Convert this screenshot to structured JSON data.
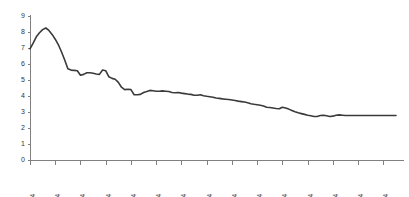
{
  "chart_data": {
    "type": "line",
    "title": "",
    "subtitle": "",
    "xlabel": "",
    "ylabel": "",
    "grid": false,
    "legend": false,
    "legend_position": "none",
    "line_color": "#3a3a3a",
    "axis_color": "#808080",
    "ylim": [
      0,
      9
    ],
    "yticks": [
      0,
      1,
      2,
      3,
      4,
      5,
      6,
      7,
      8,
      9
    ],
    "ytick_labels": [
      "0",
      "1",
      "2",
      "3",
      "4",
      "5",
      "6",
      "7",
      "8",
      "9"
    ],
    "xtick_labels": [
      "1979:4",
      "1981:4",
      "1983:4",
      "1985:4",
      "1987:4",
      "1989:4",
      "1991:4",
      "1993:4",
      "1995:4",
      "1997:4",
      "1999:4",
      "2001:4",
      "2003:4",
      "2005:4",
      "2007:4"
    ],
    "xtick_indices": [
      0,
      8,
      16,
      24,
      32,
      40,
      48,
      56,
      64,
      72,
      80,
      88,
      96,
      104,
      112
    ],
    "x": [
      "1979:4",
      "1980:1",
      "1980:2",
      "1980:3",
      "1980:4",
      "1981:1",
      "1981:2",
      "1981:3",
      "1981:4",
      "1982:1",
      "1982:2",
      "1982:3",
      "1982:4",
      "1983:1",
      "1983:2",
      "1983:3",
      "1983:4",
      "1984:1",
      "1984:2",
      "1984:3",
      "1984:4",
      "1985:1",
      "1985:2",
      "1985:3",
      "1985:4",
      "1986:1",
      "1986:2",
      "1986:3",
      "1986:4",
      "1987:1",
      "1987:2",
      "1987:3",
      "1987:4",
      "1988:1",
      "1988:2",
      "1988:3",
      "1988:4",
      "1989:1",
      "1989:2",
      "1989:3",
      "1989:4",
      "1990:1",
      "1990:2",
      "1990:3",
      "1990:4",
      "1991:1",
      "1991:2",
      "1991:3",
      "1991:4",
      "1992:1",
      "1992:2",
      "1992:3",
      "1992:4",
      "1993:1",
      "1993:2",
      "1993:3",
      "1993:4",
      "1994:1",
      "1994:2",
      "1994:3",
      "1994:4",
      "1995:1",
      "1995:2",
      "1995:3",
      "1995:4",
      "1996:1",
      "1996:2",
      "1996:3",
      "1996:4",
      "1997:1",
      "1997:2",
      "1997:3",
      "1997:4",
      "1998:1",
      "1998:2",
      "1998:3",
      "1998:4",
      "1999:1",
      "1999:2",
      "1999:3",
      "1999:4",
      "2000:1",
      "2000:2",
      "2000:3",
      "2000:4",
      "2001:1",
      "2001:2",
      "2001:3",
      "2001:4",
      "2002:1",
      "2002:2",
      "2002:3",
      "2002:4",
      "2003:1",
      "2003:2",
      "2003:3",
      "2003:4",
      "2004:1",
      "2004:2",
      "2004:3",
      "2004:4",
      "2005:1",
      "2005:2",
      "2005:3",
      "2005:4",
      "2006:1",
      "2006:2",
      "2006:3",
      "2006:4",
      "2007:1",
      "2007:2",
      "2007:3",
      "2007:4",
      "2008:1",
      "2008:2",
      "2008:3",
      "2008:4"
    ],
    "values": [
      6.95,
      7.3,
      7.7,
      7.95,
      8.15,
      8.25,
      8.1,
      7.85,
      7.55,
      7.2,
      6.75,
      6.25,
      5.7,
      5.62,
      5.6,
      5.58,
      5.3,
      5.35,
      5.45,
      5.45,
      5.42,
      5.38,
      5.35,
      5.62,
      5.58,
      5.2,
      5.1,
      5.05,
      4.85,
      4.55,
      4.4,
      4.42,
      4.4,
      4.08,
      4.08,
      4.1,
      4.22,
      4.28,
      4.35,
      4.33,
      4.3,
      4.3,
      4.32,
      4.3,
      4.28,
      4.22,
      4.2,
      4.22,
      4.18,
      4.15,
      4.12,
      4.1,
      4.05,
      4.05,
      4.08,
      4.02,
      3.98,
      3.95,
      3.92,
      3.88,
      3.85,
      3.82,
      3.8,
      3.78,
      3.75,
      3.72,
      3.68,
      3.65,
      3.62,
      3.58,
      3.52,
      3.48,
      3.45,
      3.42,
      3.38,
      3.3,
      3.28,
      3.25,
      3.22,
      3.2,
      3.3,
      3.25,
      3.18,
      3.1,
      3.02,
      2.95,
      2.9,
      2.85,
      2.8,
      2.76,
      2.72,
      2.72,
      2.78,
      2.8,
      2.76,
      2.72,
      2.74,
      2.8,
      2.82,
      2.8,
      2.78,
      2.78,
      2.78,
      2.78,
      2.78,
      2.78,
      2.78,
      2.78,
      2.78,
      2.78,
      2.78,
      2.78,
      2.78,
      2.78,
      2.78,
      2.78,
      2.78
    ],
    "layout": {
      "plot_left": 30,
      "plot_right": 396,
      "plot_top": 16,
      "plot_bottom": 160,
      "ytick_spacing_px": 16,
      "xtick_spacing_px": 26.1
    }
  }
}
